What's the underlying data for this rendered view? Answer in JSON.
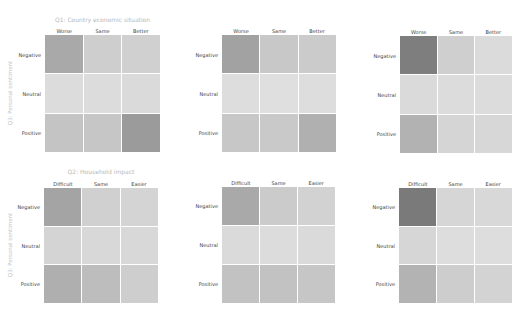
{
  "chart_data": [
    {
      "type": "heatmap",
      "title": "Q1: Country economic situation",
      "ylabel": "Q3: Personal sentiment",
      "x_categories": [
        "Worse",
        "Same",
        "Better"
      ],
      "y_categories": [
        "Negative",
        "Neutral",
        "Positive"
      ],
      "values": [
        [
          62,
          30,
          28
        ],
        [
          18,
          18,
          18
        ],
        [
          38,
          36,
          72
        ]
      ],
      "colors": [
        [
          "#a9a9a9",
          "#cecece",
          "#d0d0d0"
        ],
        [
          "#dcdcdc",
          "#dcdcdc",
          "#dadada"
        ],
        [
          "#c4c4c4",
          "#c6c6c6",
          "#9b9b9b"
        ]
      ]
    },
    {
      "type": "heatmap",
      "title": "",
      "ylabel": "",
      "x_categories": [
        "Worse",
        "Same",
        "Better"
      ],
      "y_categories": [
        "Negative",
        "Neutral",
        "Positive"
      ],
      "values": [
        [
          68,
          34,
          30
        ],
        [
          16,
          14,
          16
        ],
        [
          34,
          32,
          58
        ]
      ],
      "colors": [
        [
          "#a2a2a2",
          "#c8c8c8",
          "#cbcbcb"
        ],
        [
          "#dddddd",
          "#dfdfdf",
          "#dddddd"
        ],
        [
          "#c7c7c7",
          "#c9c9c9",
          "#b0b0b0"
        ]
      ]
    },
    {
      "type": "heatmap",
      "title": "",
      "ylabel": "",
      "x_categories": [
        "Worse",
        "Same",
        "Better"
      ],
      "y_categories": [
        "Negative",
        "Neutral",
        "Positive"
      ],
      "values": [
        [
          88,
          28,
          18
        ],
        [
          18,
          16,
          16
        ],
        [
          56,
          22,
          20
        ]
      ],
      "colors": [
        [
          "#7e7e7e",
          "#cfcfcf",
          "#dbdbdb"
        ],
        [
          "#dadada",
          "#dcdcdc",
          "#dcdcdc"
        ],
        [
          "#b2b2b2",
          "#d5d5d5",
          "#d7d7d7"
        ]
      ]
    },
    {
      "type": "heatmap",
      "title": "Q2: Household impact",
      "ylabel": "Q3: Personal sentiment",
      "x_categories": [
        "Difficult",
        "Same",
        "Easier"
      ],
      "y_categories": [
        "Negative",
        "Neutral",
        "Positive"
      ],
      "values": [
        [
          66,
          28,
          24
        ],
        [
          24,
          20,
          20
        ],
        [
          58,
          44,
          30
        ]
      ],
      "colors": [
        [
          "#a4a4a4",
          "#d0d0d0",
          "#d4d4d4"
        ],
        [
          "#d4d4d4",
          "#d8d8d8",
          "#d8d8d8"
        ],
        [
          "#afafaf",
          "#bdbdbd",
          "#cecece"
        ]
      ]
    },
    {
      "type": "heatmap",
      "title": "",
      "ylabel": "",
      "x_categories": [
        "Difficult",
        "Same",
        "Easier"
      ],
      "y_categories": [
        "Negative",
        "Neutral",
        "Positive"
      ],
      "values": [
        [
          62,
          32,
          26
        ],
        [
          18,
          16,
          18
        ],
        [
          40,
          40,
          36
        ]
      ],
      "colors": [
        [
          "#a9a9a9",
          "#cbcbcb",
          "#d2d2d2"
        ],
        [
          "#dadada",
          "#dcdcdc",
          "#dadada"
        ],
        [
          "#c2c2c2",
          "#c2c2c2",
          "#c6c6c6"
        ]
      ]
    },
    {
      "type": "heatmap",
      "title": "",
      "ylabel": "",
      "x_categories": [
        "Difficult",
        "Same",
        "Easier"
      ],
      "y_categories": [
        "Negative",
        "Neutral",
        "Positive"
      ],
      "values": [
        [
          90,
          22,
          20
        ],
        [
          22,
          16,
          16
        ],
        [
          54,
          30,
          24
        ]
      ],
      "colors": [
        [
          "#7a7a7a",
          "#d6d6d6",
          "#d8d8d8"
        ],
        [
          "#d6d6d6",
          "#dddddd",
          "#dddddd"
        ],
        [
          "#b3b3b3",
          "#cdcdcd",
          "#d3d3d3"
        ]
      ]
    }
  ],
  "panels": [
    {
      "title": "Q1: Country economic situation",
      "ylabel": "Q3: Personal sentiment",
      "cols": [
        "Worse",
        "Same",
        "Better"
      ],
      "rows": [
        "Negative",
        "Neutral",
        "Positive"
      ]
    },
    {
      "title": "",
      "ylabel": "",
      "cols": [
        "Worse",
        "Same",
        "Better"
      ],
      "rows": [
        "Negative",
        "Neutral",
        "Positive"
      ]
    },
    {
      "title": "",
      "ylabel": "",
      "cols": [
        "Worse",
        "Same",
        "Better"
      ],
      "rows": [
        "Negative",
        "Neutral",
        "Positive"
      ]
    },
    {
      "title": "Q2: Household impact",
      "ylabel": "Q3: Personal sentiment",
      "cols": [
        "Difficult",
        "Same",
        "Easier"
      ],
      "rows": [
        "Negative",
        "Neutral",
        "Positive"
      ]
    },
    {
      "title": "",
      "ylabel": "",
      "cols": [
        "Difficult",
        "Same",
        "Easier"
      ],
      "rows": [
        "Negative",
        "Neutral",
        "Positive"
      ]
    },
    {
      "title": "",
      "ylabel": "",
      "cols": [
        "Difficult",
        "Same",
        "Easier"
      ],
      "rows": [
        "Negative",
        "Neutral",
        "Positive"
      ]
    }
  ]
}
